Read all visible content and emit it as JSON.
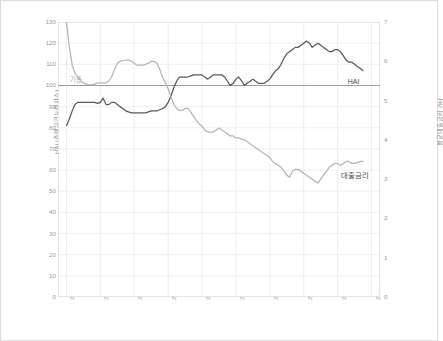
{
  "chart_data": {
    "type": "line",
    "title": "",
    "xlabel": "",
    "ylabel": "HAI (주택구입능력지수)",
    "y2label": "평균대출금리 (%)",
    "grid": true,
    "legend_position": "inline-end-of-line",
    "xlim": [
      2008.75,
      2018.25
    ],
    "ylim": [
      0,
      130
    ],
    "y2lim": [
      0,
      7
    ],
    "yticks": [
      "0",
      "10",
      "20",
      "30",
      "40",
      "50",
      "60",
      "70",
      "80",
      "90",
      "100",
      "110",
      "120",
      "130"
    ],
    "y2ticks": [
      "0",
      "1",
      "2",
      "3",
      "4",
      "5",
      "6",
      "7"
    ],
    "xticks": [
      "2009",
      "2010",
      "2011",
      "2012",
      "2013",
      "2014",
      "2015",
      "2016",
      "2017",
      "2018"
    ],
    "annotations": [
      {
        "name": "baseline-100",
        "text": "기준",
        "x": 2009.1,
        "y": 102
      },
      {
        "name": "hai-series-label",
        "text": "HAI",
        "x": 2017.3,
        "y": 101.5
      },
      {
        "name": "rate-series-label",
        "text": "대출금리",
        "x": 2017.1,
        "y": 57
      }
    ],
    "reference_line": {
      "name": "baseline",
      "axis": "left",
      "value": 100,
      "color": "#9e9e9e"
    },
    "series": [
      {
        "name": "HAI",
        "label": "HAI",
        "axis": "left",
        "color": "#595959",
        "unit": "index",
        "x": [
          2009.0,
          2009.08,
          2009.17,
          2009.25,
          2009.33,
          2009.42,
          2009.5,
          2009.58,
          2009.67,
          2009.75,
          2009.83,
          2009.92,
          2010.0,
          2010.08,
          2010.17,
          2010.25,
          2010.33,
          2010.42,
          2010.5,
          2010.58,
          2010.67,
          2010.75,
          2010.83,
          2010.92,
          2011.0,
          2011.08,
          2011.17,
          2011.25,
          2011.33,
          2011.42,
          2011.5,
          2011.58,
          2011.67,
          2011.75,
          2011.83,
          2011.92,
          2012.0,
          2012.08,
          2012.17,
          2012.25,
          2012.33,
          2012.42,
          2012.5,
          2012.58,
          2012.67,
          2012.75,
          2012.83,
          2012.92,
          2013.0,
          2013.08,
          2013.17,
          2013.25,
          2013.33,
          2013.42,
          2013.5,
          2013.58,
          2013.67,
          2013.75,
          2013.83,
          2013.92,
          2014.0,
          2014.08,
          2014.17,
          2014.25,
          2014.33,
          2014.42,
          2014.5,
          2014.58,
          2014.67,
          2014.75,
          2014.83,
          2014.92,
          2015.0,
          2015.08,
          2015.17,
          2015.25,
          2015.33,
          2015.42,
          2015.5,
          2015.58,
          2015.67,
          2015.75,
          2015.83,
          2015.92,
          2016.0,
          2016.08,
          2016.17,
          2016.25,
          2016.33,
          2016.42,
          2016.5,
          2016.58,
          2016.67,
          2016.75,
          2016.83,
          2016.92,
          2017.0,
          2017.08,
          2017.17,
          2017.25,
          2017.33,
          2017.42,
          2017.5,
          2017.58,
          2017.67,
          2017.75
        ],
        "values": [
          81,
          84,
          88,
          91,
          92,
          92,
          92,
          92,
          92,
          92,
          92,
          91.5,
          92,
          94,
          91,
          91,
          92,
          92,
          91,
          90,
          89,
          88,
          87.5,
          87,
          87,
          87,
          87,
          87,
          87,
          87.5,
          88,
          88,
          88,
          88.5,
          89,
          90,
          92,
          95,
          99,
          102,
          104,
          104,
          104,
          104,
          104.5,
          105,
          105,
          105,
          105,
          104,
          103,
          104,
          105,
          105,
          105,
          105,
          104,
          102,
          100,
          101,
          103,
          104,
          102,
          100,
          101,
          102,
          103,
          102,
          101,
          101,
          101,
          102,
          103,
          105,
          107,
          108,
          110,
          113,
          115,
          116,
          117,
          118,
          118,
          119,
          120,
          121,
          120,
          118,
          119,
          120,
          119,
          118,
          117,
          116,
          116,
          117,
          117,
          116,
          114,
          112,
          111,
          111,
          110,
          109,
          108,
          107
        ]
      },
      {
        "name": "대출금리",
        "label": "대출금리",
        "axis": "right",
        "color": "#b4b4b4",
        "unit": "%",
        "x": [
          2009.0,
          2009.08,
          2009.17,
          2009.25,
          2009.33,
          2009.42,
          2009.5,
          2009.58,
          2009.67,
          2009.75,
          2009.83,
          2009.92,
          2010.0,
          2010.08,
          2010.17,
          2010.25,
          2010.33,
          2010.42,
          2010.5,
          2010.58,
          2010.67,
          2010.75,
          2010.83,
          2010.92,
          2011.0,
          2011.08,
          2011.17,
          2011.25,
          2011.33,
          2011.42,
          2011.5,
          2011.58,
          2011.67,
          2011.75,
          2011.83,
          2011.92,
          2012.0,
          2012.08,
          2012.17,
          2012.25,
          2012.33,
          2012.42,
          2012.5,
          2012.58,
          2012.67,
          2012.75,
          2012.83,
          2012.92,
          2013.0,
          2013.08,
          2013.17,
          2013.25,
          2013.33,
          2013.42,
          2013.5,
          2013.58,
          2013.67,
          2013.75,
          2013.83,
          2013.92,
          2014.0,
          2014.08,
          2014.17,
          2014.25,
          2014.33,
          2014.42,
          2014.5,
          2014.58,
          2014.67,
          2014.75,
          2014.83,
          2014.92,
          2015.0,
          2015.08,
          2015.17,
          2015.25,
          2015.33,
          2015.42,
          2015.5,
          2015.58,
          2015.67,
          2015.75,
          2015.83,
          2015.92,
          2016.0,
          2016.08,
          2016.17,
          2016.25,
          2016.33,
          2016.42,
          2016.5,
          2016.58,
          2016.67,
          2016.75,
          2016.83,
          2016.92,
          2017.0,
          2017.08,
          2017.17,
          2017.25,
          2017.33,
          2017.42,
          2017.5,
          2017.58,
          2017.67,
          2017.75
        ],
        "values": [
          7.0,
          6.4,
          5.9,
          5.7,
          5.6,
          5.5,
          5.45,
          5.42,
          5.4,
          5.4,
          5.42,
          5.45,
          5.45,
          5.45,
          5.45,
          5.5,
          5.6,
          5.8,
          5.95,
          6.0,
          6.02,
          6.03,
          6.03,
          6.0,
          5.95,
          5.9,
          5.9,
          5.9,
          5.92,
          5.95,
          6.0,
          6.0,
          5.95,
          5.8,
          5.6,
          5.45,
          5.3,
          5.1,
          4.9,
          4.8,
          4.75,
          4.75,
          4.8,
          4.8,
          4.7,
          4.6,
          4.5,
          4.4,
          4.35,
          4.25,
          4.2,
          4.2,
          4.2,
          4.25,
          4.3,
          4.25,
          4.2,
          4.15,
          4.1,
          4.1,
          4.05,
          4.05,
          4.02,
          4.0,
          3.95,
          3.9,
          3.85,
          3.8,
          3.75,
          3.7,
          3.65,
          3.6,
          3.55,
          3.45,
          3.4,
          3.35,
          3.3,
          3.2,
          3.1,
          3.05,
          3.2,
          3.25,
          3.25,
          3.2,
          3.15,
          3.1,
          3.05,
          3.0,
          2.95,
          2.9,
          3.0,
          3.1,
          3.2,
          3.3,
          3.35,
          3.4,
          3.4,
          3.35,
          3.4,
          3.45,
          3.45,
          3.4,
          3.4,
          3.42,
          3.45,
          3.45
        ]
      }
    ]
  },
  "watermark": {
    "text": ""
  }
}
